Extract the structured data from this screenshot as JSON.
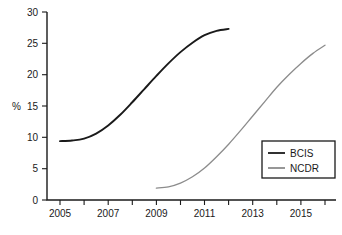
{
  "chart_data": {
    "type": "line",
    "title": "",
    "xlabel": "",
    "ylabel": "%",
    "xlim": [
      2005,
      2016
    ],
    "ylim": [
      0,
      30
    ],
    "grid": false,
    "legend_position": "bottom-right",
    "y_ticks": [
      0,
      5,
      10,
      15,
      20,
      25,
      30
    ],
    "y_tick_labels": [
      "0",
      "5",
      "10",
      "15",
      "20",
      "25",
      "30"
    ],
    "x_ticks": [
      2005,
      2006,
      2007,
      2008,
      2009,
      2010,
      2011,
      2012,
      2013,
      2014,
      2015,
      2016
    ],
    "x_tick_labels": [
      "2005",
      "",
      "2007",
      "",
      "2009",
      "",
      "2011",
      "",
      "2013",
      "",
      "2015",
      ""
    ],
    "series": [
      {
        "name": "BCIS",
        "color": "#1a1a1a",
        "x": [
          2005,
          2005.5,
          2006,
          2006.5,
          2007,
          2007.5,
          2008,
          2008.5,
          2009,
          2009.5,
          2010,
          2010.5,
          2011,
          2011.5,
          2012
        ],
        "values": [
          9.4,
          9.5,
          9.8,
          10.6,
          11.9,
          13.6,
          15.6,
          17.7,
          19.8,
          21.8,
          23.6,
          25.1,
          26.3,
          27.0,
          27.3
        ]
      },
      {
        "name": "NCDR",
        "color": "#8c8c8c",
        "x": [
          2009,
          2009.5,
          2010,
          2010.5,
          2011,
          2011.5,
          2012,
          2012.5,
          2013,
          2013.5,
          2014,
          2014.5,
          2015,
          2015.5,
          2016
        ],
        "values": [
          1.9,
          2.1,
          2.7,
          3.7,
          5.1,
          6.9,
          8.9,
          11.1,
          13.4,
          15.7,
          18.0,
          20.0,
          21.8,
          23.4,
          24.7
        ]
      }
    ]
  },
  "legend": {
    "entries": [
      {
        "label": "BCIS"
      },
      {
        "label": "NCDR"
      }
    ]
  },
  "caption": {
    "text": ""
  }
}
